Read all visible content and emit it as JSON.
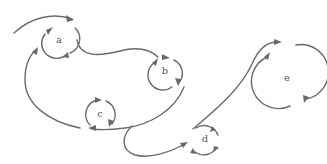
{
  "diagram": {
    "stroke_color": "#6a6a6a",
    "label_color": "#555555",
    "loops": [
      {
        "id": "a",
        "label": "a",
        "cx": 58,
        "cy": 42,
        "r": 15
      },
      {
        "id": "b",
        "label": "b",
        "cx": 165,
        "cy": 72,
        "r": 15
      },
      {
        "id": "c",
        "label": "c",
        "cx": 100,
        "cy": 115,
        "r": 15
      },
      {
        "id": "d",
        "label": "d",
        "cx": 205,
        "cy": 140,
        "r": 15
      },
      {
        "id": "e",
        "label": "e",
        "cx": 286,
        "cy": 80,
        "r": 27
      }
    ]
  }
}
